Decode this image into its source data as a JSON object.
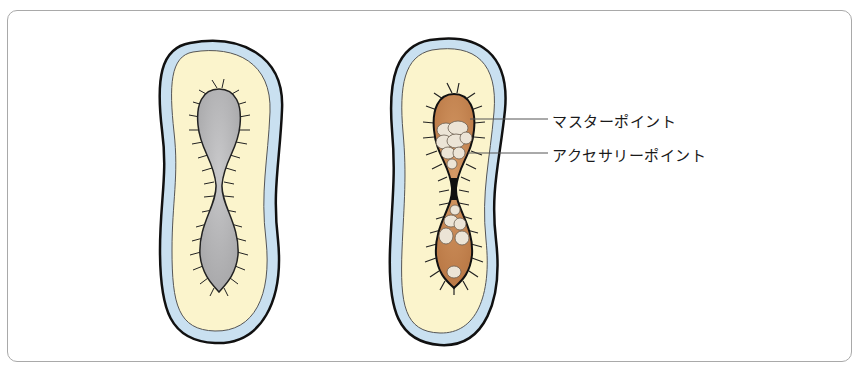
{
  "diagram": {
    "left_figure": {
      "name": "clean-tooth-section"
    },
    "right_figure": {
      "name": "tooth-section-with-points",
      "labels": [
        {
          "id": "master",
          "text": "マスターポイント"
        },
        {
          "id": "accessory",
          "text": "アクセサリーポイント"
        }
      ]
    },
    "colors": {
      "outer_layer": "#c9e0f0",
      "dentin": "#fbf4cc",
      "canal_empty": "#b8b8ba",
      "master_point": "#c98a55",
      "accessory_point": "#e8e0d4",
      "outline": "#1a1a1a",
      "frame": "#a9a9a9"
    }
  }
}
